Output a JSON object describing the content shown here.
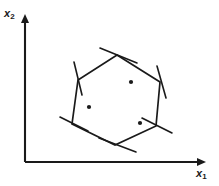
{
  "figure": {
    "kind": "feasible-region-polytope-diagram",
    "background_color": "#ffffff",
    "ink_color": "#1a1a1a",
    "width": 219,
    "height": 186
  },
  "axes": {
    "x_label_base": "x",
    "x_label_sub": "1",
    "y_label_base": "x",
    "y_label_sub": "2",
    "origin": {
      "x": 25,
      "y": 162
    },
    "x_axis_end": {
      "x": 205,
      "y": 162
    },
    "y_axis_end": {
      "x": 25,
      "y": 15
    },
    "arrow_heads": true,
    "ticks": false,
    "grid": false,
    "color": "#1a1a1a"
  },
  "chart_data": {
    "type": "scatter",
    "title": "",
    "xlabel": "x1",
    "ylabel": "x2",
    "grid": false,
    "legend": "none",
    "polygon": {
      "name": "feasible-region-hexagon",
      "sides": 6,
      "closed": true,
      "vertices": [
        {
          "id": "v-top",
          "x": 117,
          "y": 55
        },
        {
          "id": "v-upper-right",
          "x": 160,
          "y": 82
        },
        {
          "id": "v-lower-right",
          "x": 156,
          "y": 126
        },
        {
          "id": "v-bottom",
          "x": 115,
          "y": 145
        },
        {
          "id": "v-lower-left",
          "x": 72,
          "y": 124
        },
        {
          "id": "v-upper-left",
          "x": 78,
          "y": 80
        }
      ]
    },
    "constraint_lines": [
      {
        "id": "cut-top",
        "x1": 100,
        "y1": 48,
        "x2": 137,
        "y2": 63
      },
      {
        "id": "cut-upper-right",
        "x1": 157,
        "y1": 66,
        "x2": 166,
        "y2": 98
      },
      {
        "id": "cut-lower-right",
        "x1": 142,
        "y1": 118,
        "x2": 172,
        "y2": 133
      },
      {
        "id": "cut-bottom",
        "x1": 99,
        "y1": 138,
        "x2": 136,
        "y2": 152
      },
      {
        "id": "cut-lower-left",
        "x1": 60,
        "y1": 117,
        "x2": 88,
        "y2": 131
      },
      {
        "id": "cut-upper-left",
        "x1": 74,
        "y1": 62,
        "x2": 82,
        "y2": 95
      }
    ],
    "points": [
      {
        "id": "point-1",
        "x": 131,
        "y": 82,
        "radius": 2.1
      },
      {
        "id": "point-2",
        "x": 89,
        "y": 107,
        "radius": 2.1
      },
      {
        "id": "point-3",
        "x": 140,
        "y": 123,
        "radius": 2.1
      }
    ]
  }
}
